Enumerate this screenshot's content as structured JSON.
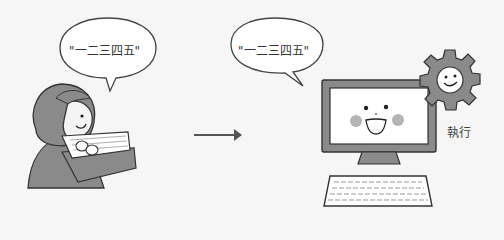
{
  "user_bubble": {
    "text": "\"一二三四五\""
  },
  "computer_bubble": {
    "text": "\"一二三四五\""
  },
  "execute_label": "執行",
  "colors": {
    "background": "#f6f6f6",
    "outline": "#333333",
    "gray_fill": "#8a8a8a",
    "light_fill": "#ffffff",
    "cheek": "#b5b5b5"
  }
}
